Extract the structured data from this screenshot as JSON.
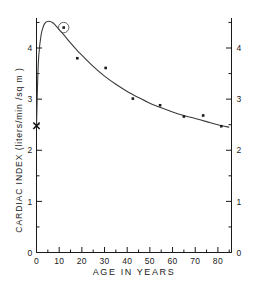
{
  "chart_data": {
    "type": "line",
    "title": "",
    "subtitle": "",
    "xlabel": "AGE  IN  YEARS",
    "ylabel": "CARDIAC  INDEX   (liters/min /sq m )",
    "ylabel_right": "",
    "xlim": [
      0,
      86
    ],
    "ylim": [
      0,
      4.75
    ],
    "grid": false,
    "legend": null,
    "x_ticks": [
      0,
      10,
      20,
      30,
      40,
      50,
      60,
      70,
      80
    ],
    "x_tick_labels": [
      "0",
      "10",
      "20",
      "30",
      "40",
      "50",
      "60",
      "70",
      "80"
    ],
    "x_minor_ticks": [
      5,
      15,
      25,
      35,
      45,
      55,
      65,
      75,
      85
    ],
    "y_ticks": [
      0,
      1,
      2,
      3,
      4
    ],
    "y_tick_labels": [
      "0",
      "1",
      "2",
      "3",
      "4"
    ],
    "y_tick_labels_right": [
      "0",
      "1",
      "2",
      "3",
      "4"
    ],
    "y_minor_ticks": [
      0.5,
      1.5,
      2.5,
      3.5,
      4.5
    ],
    "series": [
      {
        "name": "fitted curve",
        "type": "line",
        "x": [
          0,
          0.5,
          1,
          2,
          3,
          4,
          5,
          6,
          7,
          8,
          10,
          12,
          15,
          18,
          20,
          25,
          30,
          35,
          40,
          45,
          50,
          55,
          60,
          65,
          70,
          75,
          80,
          85
        ],
        "y": [
          2.45,
          3.35,
          3.85,
          4.25,
          4.42,
          4.5,
          4.52,
          4.52,
          4.5,
          4.46,
          4.36,
          4.26,
          4.1,
          3.95,
          3.86,
          3.64,
          3.45,
          3.29,
          3.15,
          3.03,
          2.92,
          2.83,
          2.75,
          2.68,
          2.62,
          2.56,
          2.5,
          2.45
        ]
      },
      {
        "name": "observed means",
        "type": "scatter",
        "points": [
          {
            "x": 12,
            "y": 4.4,
            "circled": true
          },
          {
            "x": 18,
            "y": 3.8,
            "circled": false
          },
          {
            "x": 30.5,
            "y": 3.61,
            "circled": false
          },
          {
            "x": 42.5,
            "y": 3.01,
            "circled": false
          },
          {
            "x": 54.5,
            "y": 2.88,
            "circled": false
          },
          {
            "x": 65,
            "y": 2.66,
            "circled": false
          },
          {
            "x": 73.5,
            "y": 2.68,
            "circled": false
          },
          {
            "x": 81.5,
            "y": 2.47,
            "circled": false
          }
        ]
      },
      {
        "name": "newborn value marker",
        "type": "marker",
        "marker": "x",
        "points": [
          {
            "x": 0,
            "y": 2.48
          }
        ]
      }
    ],
    "annotations": [
      {
        "kind": "circled-point",
        "x": 12,
        "y": 4.4,
        "note": "circled data point"
      },
      {
        "kind": "x-marker",
        "x": 0,
        "y": 2.48,
        "note": "x marker on y-axis"
      }
    ],
    "colors": {
      "axis": "#1a1a1a",
      "curve": "#3a3a3a",
      "point": "#1a1a1a",
      "background": "#ffffff"
    }
  }
}
